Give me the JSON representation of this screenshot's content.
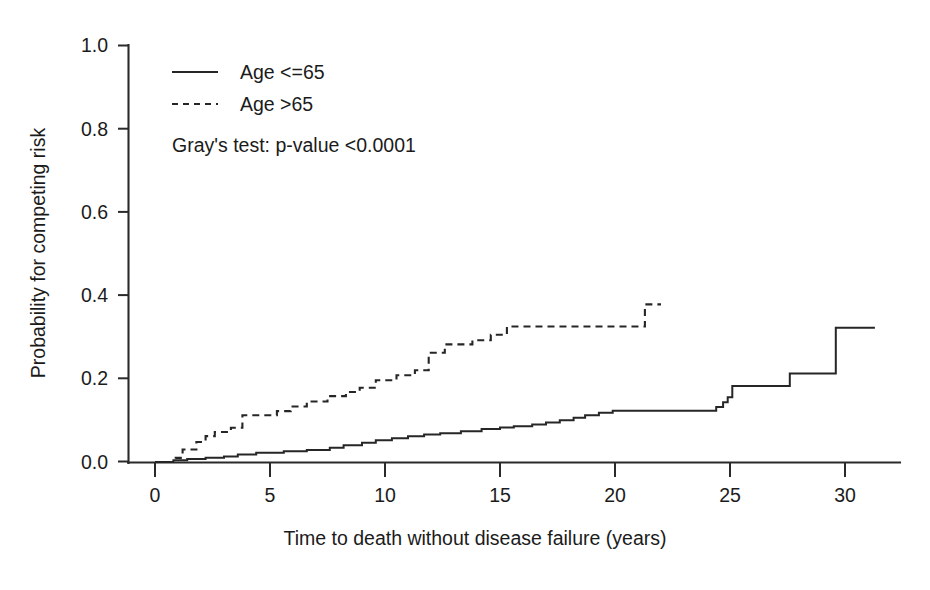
{
  "chart_data": {
    "type": "line",
    "title": "",
    "xlabel": "Time to death without disease failure (years)",
    "ylabel": "Probability for competing risk",
    "xlim": [
      -0.6,
      31.8
    ],
    "ylim": [
      0.0,
      1.04
    ],
    "xticks": [
      0,
      5,
      10,
      15,
      20,
      25,
      30
    ],
    "xticklabels": [
      "0",
      "5",
      "10",
      "15",
      "20",
      "25",
      "30"
    ],
    "yticks": [
      0.0,
      0.2,
      0.4,
      0.6,
      0.8,
      1.0
    ],
    "yticklabels": [
      "0.0",
      "0.2",
      "0.4",
      "0.6",
      "0.8",
      "1.0"
    ],
    "grid": false,
    "legend_position": "upper-left",
    "annotation": "Gray's test: p-value <0.0001",
    "series": [
      {
        "name": "Age <=65",
        "style": "solid",
        "color": "#262626",
        "points": [
          [
            0.0,
            0.0
          ],
          [
            0.8,
            0.0
          ],
          [
            0.8,
            0.004
          ],
          [
            1.4,
            0.004
          ],
          [
            1.4,
            0.007
          ],
          [
            2.2,
            0.007
          ],
          [
            2.2,
            0.01
          ],
          [
            3.0,
            0.01
          ],
          [
            3.0,
            0.013
          ],
          [
            3.6,
            0.013
          ],
          [
            3.6,
            0.018
          ],
          [
            4.4,
            0.018
          ],
          [
            4.4,
            0.022
          ],
          [
            5.6,
            0.022
          ],
          [
            5.6,
            0.026
          ],
          [
            6.6,
            0.026
          ],
          [
            6.6,
            0.029
          ],
          [
            7.6,
            0.029
          ],
          [
            7.6,
            0.034
          ],
          [
            8.2,
            0.034
          ],
          [
            8.2,
            0.04
          ],
          [
            9.0,
            0.04
          ],
          [
            9.0,
            0.046
          ],
          [
            9.6,
            0.046
          ],
          [
            9.6,
            0.052
          ],
          [
            10.3,
            0.052
          ],
          [
            10.3,
            0.057
          ],
          [
            11.0,
            0.057
          ],
          [
            11.0,
            0.062
          ],
          [
            11.7,
            0.062
          ],
          [
            11.7,
            0.066
          ],
          [
            12.4,
            0.066
          ],
          [
            12.4,
            0.069
          ],
          [
            13.3,
            0.069
          ],
          [
            13.3,
            0.074
          ],
          [
            14.2,
            0.074
          ],
          [
            14.2,
            0.079
          ],
          [
            15.0,
            0.079
          ],
          [
            15.0,
            0.083
          ],
          [
            15.6,
            0.083
          ],
          [
            15.6,
            0.086
          ],
          [
            16.4,
            0.086
          ],
          [
            16.4,
            0.09
          ],
          [
            17.0,
            0.09
          ],
          [
            17.0,
            0.095
          ],
          [
            17.6,
            0.095
          ],
          [
            17.6,
            0.1
          ],
          [
            18.2,
            0.1
          ],
          [
            18.2,
            0.106
          ],
          [
            18.7,
            0.106
          ],
          [
            18.7,
            0.112
          ],
          [
            19.3,
            0.112
          ],
          [
            19.3,
            0.118
          ],
          [
            19.9,
            0.118
          ],
          [
            19.9,
            0.123
          ],
          [
            24.4,
            0.123
          ],
          [
            24.4,
            0.132
          ],
          [
            24.7,
            0.132
          ],
          [
            24.7,
            0.143
          ],
          [
            24.9,
            0.143
          ],
          [
            24.9,
            0.155
          ],
          [
            25.1,
            0.155
          ],
          [
            25.1,
            0.182
          ],
          [
            27.6,
            0.182
          ],
          [
            27.6,
            0.212
          ],
          [
            29.6,
            0.212
          ],
          [
            29.6,
            0.322
          ],
          [
            31.3,
            0.322
          ]
        ]
      },
      {
        "name": "Age >65",
        "style": "dashed",
        "color": "#262626",
        "points": [
          [
            0.0,
            0.0
          ],
          [
            0.9,
            0.0
          ],
          [
            0.9,
            0.01
          ],
          [
            1.2,
            0.01
          ],
          [
            1.2,
            0.03
          ],
          [
            1.8,
            0.03
          ],
          [
            1.8,
            0.048
          ],
          [
            2.2,
            0.048
          ],
          [
            2.2,
            0.062
          ],
          [
            2.6,
            0.062
          ],
          [
            2.6,
            0.072
          ],
          [
            3.3,
            0.072
          ],
          [
            3.3,
            0.082
          ],
          [
            3.8,
            0.082
          ],
          [
            3.8,
            0.112
          ],
          [
            5.3,
            0.112
          ],
          [
            5.3,
            0.122
          ],
          [
            5.9,
            0.122
          ],
          [
            5.9,
            0.133
          ],
          [
            6.6,
            0.133
          ],
          [
            6.6,
            0.145
          ],
          [
            7.5,
            0.145
          ],
          [
            7.5,
            0.158
          ],
          [
            8.3,
            0.158
          ],
          [
            8.3,
            0.168
          ],
          [
            8.9,
            0.168
          ],
          [
            8.9,
            0.178
          ],
          [
            9.6,
            0.178
          ],
          [
            9.6,
            0.196
          ],
          [
            10.5,
            0.196
          ],
          [
            10.5,
            0.208
          ],
          [
            11.3,
            0.208
          ],
          [
            11.3,
            0.22
          ],
          [
            11.9,
            0.22
          ],
          [
            11.9,
            0.262
          ],
          [
            12.6,
            0.262
          ],
          [
            12.6,
            0.282
          ],
          [
            13.8,
            0.282
          ],
          [
            13.8,
            0.292
          ],
          [
            14.6,
            0.292
          ],
          [
            14.6,
            0.305
          ],
          [
            15.3,
            0.305
          ],
          [
            15.3,
            0.325
          ],
          [
            21.3,
            0.325
          ],
          [
            21.3,
            0.378
          ],
          [
            22.0,
            0.378
          ]
        ]
      }
    ]
  },
  "legend": {
    "items": [
      {
        "label": "Age <=65",
        "style": "solid"
      },
      {
        "label": "Age >65",
        "style": "dashed"
      }
    ]
  }
}
